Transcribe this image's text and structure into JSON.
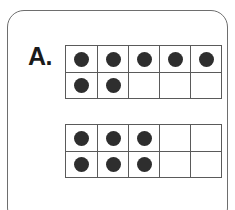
{
  "worksheet": {
    "problem_label": "A.",
    "style": {
      "card_border_color": "#6e6e6e",
      "frame_border_color": "#5a5a5a",
      "dot_color": "#2e2e2e",
      "background_color": "#ffffff",
      "label_color": "#1a1a1a"
    },
    "ten_frames": [
      {
        "name": "ten-frame-1",
        "columns": 5,
        "rows": 2,
        "filled_count": 7,
        "cells": [
          [
            true,
            true,
            true,
            true,
            true
          ],
          [
            true,
            true,
            false,
            false,
            false
          ]
        ]
      },
      {
        "name": "ten-frame-2",
        "columns": 5,
        "rows": 2,
        "filled_count": 6,
        "cells": [
          [
            true,
            true,
            true,
            false,
            false
          ],
          [
            true,
            true,
            true,
            false,
            false
          ]
        ]
      }
    ]
  }
}
